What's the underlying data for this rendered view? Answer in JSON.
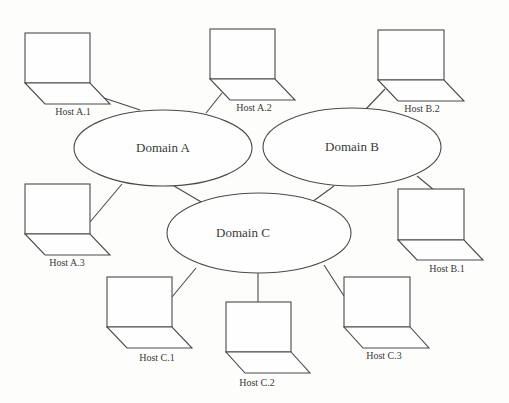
{
  "diagram": {
    "type": "network-topology",
    "domains": [
      {
        "id": "A",
        "label": "Domain A",
        "cx": 163,
        "cy": 148,
        "rx": 89,
        "ry": 38
      },
      {
        "id": "B",
        "label": "Domain B",
        "cx": 352,
        "cy": 147,
        "rx": 89,
        "ry": 39
      },
      {
        "id": "C",
        "label": "Domain C",
        "cx": 259,
        "cy": 233,
        "rx": 92,
        "ry": 40
      }
    ],
    "hosts": [
      {
        "id": "A1",
        "label": "Host A.1",
        "domain": "A",
        "x": 25,
        "y": 33
      },
      {
        "id": "A2",
        "label": "Host A.2",
        "domain": "A",
        "x": 210,
        "y": 29
      },
      {
        "id": "A3",
        "label": "Host A.3",
        "domain": "A",
        "x": 25,
        "y": 184
      },
      {
        "id": "B1",
        "label": "Host B.1",
        "domain": "B",
        "x": 398,
        "y": 189
      },
      {
        "id": "B2",
        "label": "Host B.2",
        "domain": "B",
        "x": 378,
        "y": 30
      },
      {
        "id": "C1",
        "label": "Host C.1",
        "domain": "C",
        "x": 107,
        "y": 277
      },
      {
        "id": "C2",
        "label": "Host C.2",
        "domain": "C",
        "x": 226,
        "y": 302
      },
      {
        "id": "C3",
        "label": "Host C.3",
        "domain": "C",
        "x": 344,
        "y": 277
      }
    ],
    "links": [
      {
        "from": "A1",
        "to": "A"
      },
      {
        "from": "A2",
        "to": "A"
      },
      {
        "from": "A3",
        "to": "A"
      },
      {
        "from": "B2",
        "to": "B"
      },
      {
        "from": "B1",
        "to": "B"
      },
      {
        "from": "C1",
        "to": "C"
      },
      {
        "from": "C2",
        "to": "C"
      },
      {
        "from": "C3",
        "to": "C"
      },
      {
        "from": "A",
        "to": "C"
      },
      {
        "from": "B",
        "to": "C"
      }
    ]
  }
}
